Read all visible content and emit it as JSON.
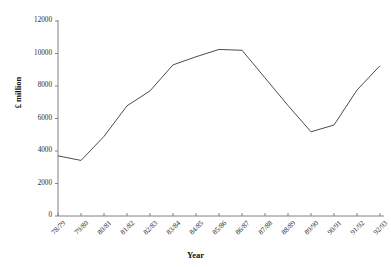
{
  "chart_data": {
    "type": "line",
    "title": "",
    "subtitle": "",
    "xlabel": "Year",
    "ylabel": "£ million",
    "categories": [
      "78/79",
      "79/80",
      "80/81",
      "81/82",
      "82/83",
      "83/84",
      "84/85",
      "85/86",
      "86/87",
      "87/88",
      "88/89",
      "89/90",
      "90/91",
      "91/92",
      "92/93"
    ],
    "values": [
      3700,
      3420,
      4900,
      6780,
      7700,
      9300,
      9800,
      10250,
      10200,
      8500,
      6800,
      5180,
      5600,
      7750,
      9250
    ],
    "series": [
      {
        "name": "£ million",
        "values": [
          3700,
          3420,
          4900,
          6780,
          7700,
          9300,
          9800,
          10250,
          10200,
          8500,
          6800,
          5180,
          5600,
          7750,
          9250
        ]
      }
    ],
    "ylim": [
      0,
      12000
    ],
    "yticks": [
      0,
      2000,
      4000,
      6000,
      8000,
      10000,
      12000
    ],
    "yticklabels": [
      "0",
      "2000",
      "4000",
      "6000",
      "8000",
      "10000",
      "12000"
    ],
    "xticklabels": [
      "78/79",
      "79/80",
      "80/81",
      "81/82",
      "82/83",
      "83/84",
      "84/85",
      "85/86",
      "86/87",
      "87/88",
      "88/89",
      "89/90",
      "90/91",
      "91/92",
      "92/93"
    ],
    "grid": false,
    "legend": null,
    "legend_position": "none",
    "line_color": "#4d4d4d",
    "axis_color": "#808080",
    "background_color": "#ffffff"
  }
}
